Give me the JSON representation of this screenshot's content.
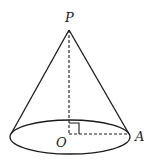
{
  "diagram": {
    "type": "cone",
    "labels": {
      "apex": "P",
      "center": "O",
      "rim_point": "A"
    },
    "colors": {
      "stroke": "#1a1a1a",
      "label": "#222222",
      "background": "#ffffff"
    },
    "geometry": {
      "apex": [
        69,
        30
      ],
      "base_center": [
        69,
        135
      ],
      "base_rx": 60,
      "base_ry": 17,
      "rim_point": [
        129,
        134
      ],
      "height_line": "dashed",
      "radius_line": "dashed",
      "right_angle_marker": true
    }
  }
}
